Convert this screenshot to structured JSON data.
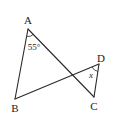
{
  "diagram": {
    "type": "geometry",
    "points": {
      "A": {
        "label": "A",
        "x": 28,
        "y": 29,
        "lx": 28,
        "ly": 24
      },
      "B": {
        "label": "B",
        "x": 15,
        "y": 99,
        "lx": 15,
        "ly": 112
      },
      "C": {
        "label": "C",
        "x": 94,
        "y": 97,
        "lx": 94,
        "ly": 110
      },
      "D": {
        "label": "D",
        "x": 99,
        "y": 64,
        "lx": 101,
        "ly": 62
      }
    },
    "segments": [
      [
        "A",
        "B"
      ],
      [
        "A",
        "C"
      ],
      [
        "B",
        "D"
      ],
      [
        "D",
        "C"
      ]
    ],
    "angles": [
      {
        "vertex": "A",
        "label": "55°"
      },
      {
        "vertex": "D",
        "label": "x"
      }
    ],
    "colors": {
      "stroke": "#2a2a2a",
      "background": "#ffffff"
    }
  }
}
